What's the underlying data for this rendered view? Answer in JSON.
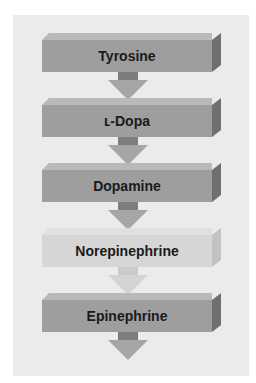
{
  "diagram": {
    "type": "pathway",
    "steps": [
      {
        "label": "Tyrosine"
      },
      {
        "label": "ʟ-Dopa"
      },
      {
        "label": "Dopamine"
      },
      {
        "label": "Norepinephrine"
      },
      {
        "label": "Epinephrine"
      }
    ],
    "colors": {
      "panel": "#ebebeb",
      "box_front": "#9e9e9e",
      "box_side": "#6f6f6f",
      "box_faded": "#d6d6d6",
      "text": "#1a1a1a"
    }
  }
}
